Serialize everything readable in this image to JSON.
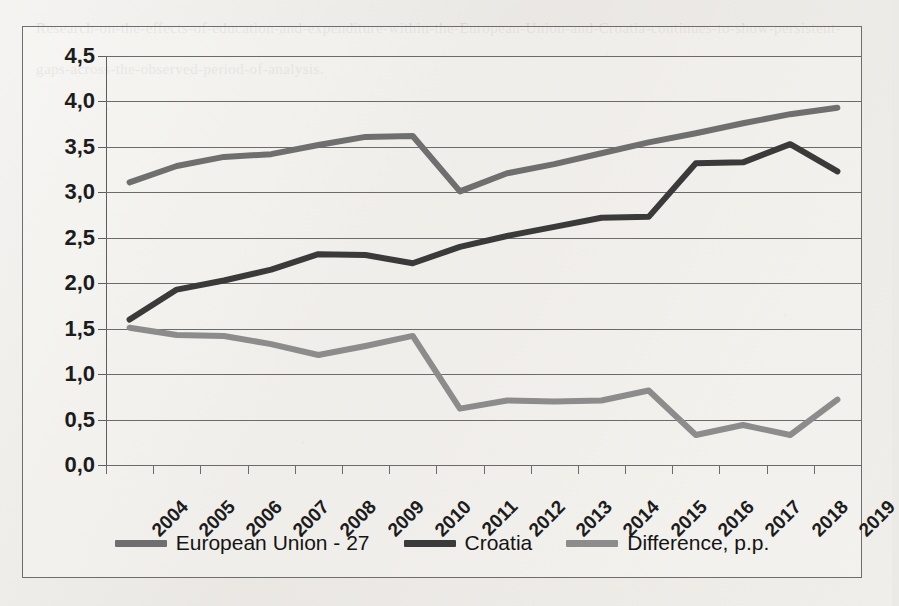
{
  "chart_data": {
    "type": "line",
    "title": "",
    "xlabel": "",
    "ylabel": "",
    "ylim": [
      0.0,
      4.5
    ],
    "ytick_step": 0.5,
    "grid": true,
    "legend_position": "bottom",
    "decimal_separator": ",",
    "ytick_labels": [
      "0,0",
      "0,5",
      "1,0",
      "1,5",
      "2,0",
      "2,5",
      "3,0",
      "3,5",
      "4,0",
      "4,5"
    ],
    "ytick_values": [
      0.0,
      0.5,
      1.0,
      1.5,
      2.0,
      2.5,
      3.0,
      3.5,
      4.0,
      4.5
    ],
    "categories": [
      "2004",
      "2005",
      "2006",
      "2007",
      "2008",
      "2009",
      "2010",
      "2011",
      "2012",
      "2013",
      "2014",
      "2015",
      "2016",
      "2017",
      "2018",
      "2019"
    ],
    "series": [
      {
        "name": "European Union - 27",
        "color": "#6f6f6f",
        "values": [
          3.11,
          3.29,
          3.39,
          3.42,
          3.52,
          3.61,
          3.62,
          3.01,
          3.21,
          3.31,
          3.43,
          3.55,
          3.65,
          3.76,
          3.86,
          3.93
        ]
      },
      {
        "name": "Croatia",
        "color": "#3a3a3a",
        "values": [
          1.6,
          1.93,
          2.03,
          2.15,
          2.32,
          2.31,
          2.22,
          2.4,
          2.52,
          2.62,
          2.72,
          2.73,
          3.32,
          3.33,
          3.53,
          3.23
        ]
      },
      {
        "name": "Difference, p.p.",
        "color": "#8c8c8c",
        "values": [
          1.51,
          1.43,
          1.42,
          1.33,
          1.21,
          1.31,
          1.42,
          0.62,
          0.71,
          0.7,
          0.71,
          0.82,
          0.33,
          0.44,
          0.33,
          0.72
        ]
      }
    ]
  },
  "legend": {
    "items": [
      {
        "label": "European Union - 27",
        "color": "#6f6f6f"
      },
      {
        "label": "Croatia",
        "color": "#3a3a3a"
      },
      {
        "label": "Difference, p.p.",
        "color": "#8c8c8c"
      }
    ]
  },
  "background_texture": "Research-on-the-effects-of-education-and-expenditure-within-the-European-Union-and-Croatia-continues-to-show-persistent-gaps-across-the-observed-period-of-analysis."
}
